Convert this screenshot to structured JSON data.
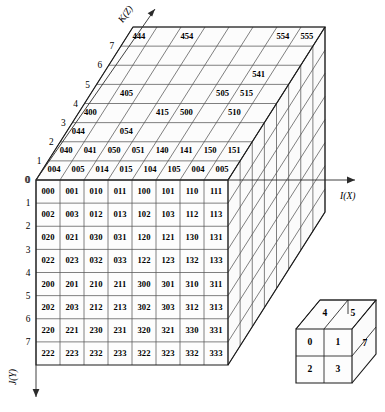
{
  "figure": {
    "title": "",
    "caption": "",
    "axes": {
      "x": "I(X)",
      "y": "J(Y)",
      "z": "K(Z)"
    },
    "tick_labels_y": [
      "0",
      "1",
      "2",
      "3",
      "4",
      "5",
      "6",
      "7"
    ],
    "tick_labels_z": [
      "0",
      "1",
      "2",
      "3",
      "4",
      "5",
      "6",
      "7"
    ],
    "grid_size": 8
  },
  "front_face": {
    "rows": [
      [
        "000",
        "001",
        "010",
        "011",
        "100",
        "101",
        "110",
        "111"
      ],
      [
        "002",
        "003",
        "012",
        "013",
        "102",
        "103",
        "112",
        "113"
      ],
      [
        "020",
        "021",
        "030",
        "031",
        "120",
        "121",
        "130",
        "131"
      ],
      [
        "022",
        "023",
        "032",
        "033",
        "122",
        "123",
        "132",
        "133"
      ],
      [
        "200",
        "201",
        "210",
        "211",
        "300",
        "301",
        "310",
        "311"
      ],
      [
        "202",
        "203",
        "212",
        "213",
        "302",
        "303",
        "312",
        "313"
      ],
      [
        "220",
        "221",
        "230",
        "231",
        "320",
        "321",
        "330",
        "331"
      ],
      [
        "222",
        "223",
        "232",
        "233",
        "322",
        "323",
        "332",
        "333"
      ]
    ]
  },
  "top_face": {
    "labels": [
      {
        "text": "004",
        "row": 0,
        "col": 0
      },
      {
        "text": "005",
        "row": 0,
        "col": 1
      },
      {
        "text": "014",
        "row": 0,
        "col": 2
      },
      {
        "text": "015",
        "row": 0,
        "col": 3
      },
      {
        "text": "104",
        "row": 0,
        "col": 4
      },
      {
        "text": "105",
        "row": 0,
        "col": 5
      },
      {
        "text": "004",
        "row": 0,
        "col": 6
      },
      {
        "text": "005",
        "row": 0,
        "col": 7
      },
      {
        "text": "040",
        "row": 1,
        "col": 0
      },
      {
        "text": "041",
        "row": 1,
        "col": 1
      },
      {
        "text": "050",
        "row": 1,
        "col": 2
      },
      {
        "text": "051",
        "row": 1,
        "col": 3
      },
      {
        "text": "140",
        "row": 1,
        "col": 4
      },
      {
        "text": "141",
        "row": 1,
        "col": 5
      },
      {
        "text": "150",
        "row": 1,
        "col": 6
      },
      {
        "text": "151",
        "row": 1,
        "col": 7
      },
      {
        "text": "044",
        "row": 2,
        "col": 0
      },
      {
        "text": "054",
        "row": 2,
        "col": 2
      },
      {
        "text": "400",
        "row": 3,
        "col": 0
      },
      {
        "text": "415",
        "row": 3,
        "col": 3
      },
      {
        "text": "500",
        "row": 3,
        "col": 4
      },
      {
        "text": "510",
        "row": 3,
        "col": 6
      },
      {
        "text": "405",
        "row": 4,
        "col": 1
      },
      {
        "text": "505",
        "row": 4,
        "col": 5
      },
      {
        "text": "515",
        "row": 4,
        "col": 6
      },
      {
        "text": "541",
        "row": 5,
        "col": 6
      },
      {
        "text": "444",
        "row": 7,
        "col": 0
      },
      {
        "text": "454",
        "row": 7,
        "col": 2
      },
      {
        "text": "554",
        "row": 7,
        "col": 6
      },
      {
        "text": "555",
        "row": 7,
        "col": 7
      }
    ]
  },
  "inset_cube": {
    "front": [
      "0",
      "1",
      "2",
      "3"
    ],
    "top": [
      "4",
      "5"
    ],
    "right": [
      "7"
    ]
  }
}
